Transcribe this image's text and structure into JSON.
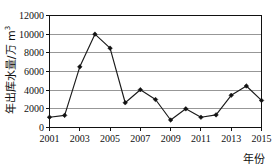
{
  "chart_data": {
    "type": "line",
    "title": "",
    "xlabel": "年份",
    "ylabel": "年出库水量/万 m³",
    "ylabel_main": "年出库水量/万 m",
    "ylabel_sup": "3",
    "x": [
      2001,
      2002,
      2003,
      2004,
      2005,
      2006,
      2007,
      2008,
      2009,
      2010,
      2011,
      2012,
      2013,
      2014,
      2015
    ],
    "values": [
      1100,
      1300,
      6500,
      10000,
      8500,
      2650,
      4050,
      3000,
      800,
      2000,
      1100,
      1350,
      3450,
      4450,
      2900
    ],
    "categories": [
      "2001",
      "2002",
      "2003",
      "2004",
      "2005",
      "2006",
      "2007",
      "2008",
      "2009",
      "2010",
      "2011",
      "2012",
      "2013",
      "2014",
      "2015"
    ],
    "x_tick_labels": [
      "2001",
      "2003",
      "2005",
      "2007",
      "2009",
      "2011",
      "2013",
      "2015"
    ],
    "x_tick_values": [
      2001,
      2003,
      2005,
      2007,
      2009,
      2011,
      2013,
      2015
    ],
    "y_tick_labels": [
      "0",
      "2000",
      "4000",
      "6000",
      "8000",
      "10000",
      "12000"
    ],
    "y_tick_values": [
      0,
      2000,
      4000,
      6000,
      8000,
      10000,
      12000
    ],
    "xlim": [
      2001,
      2015
    ],
    "ylim": [
      0,
      12000
    ],
    "grid": "horizontal",
    "legend": "none",
    "series_name": "年出库水量",
    "line_color": "#1a1a1a",
    "marker": "diamond",
    "marker_color": "#111111",
    "grid_color": "#8c8c8c",
    "axis_color": "#111111",
    "background": "#ffffff"
  }
}
